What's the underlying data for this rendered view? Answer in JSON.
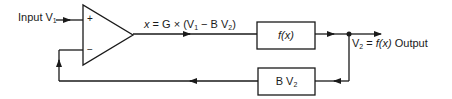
{
  "diagram": {
    "type": "feedback-amplifier-block-diagram",
    "input_label": {
      "text": "Input V",
      "sub": "1"
    },
    "amplifier": {
      "plus_sign": "+",
      "minus_sign": "−"
    },
    "equation": {
      "x": "x",
      "eq": " = G × (V",
      "sub1": "1",
      "mid": " − B V",
      "sub2": "2",
      "close": ")"
    },
    "forward_block": {
      "label": "f(x)"
    },
    "feedback_block": {
      "label": "B V",
      "sub": "2"
    },
    "output_label": {
      "pre": "V",
      "sub": "2",
      "eq": " = ",
      "fx": "f(x)",
      "post": " Output"
    }
  }
}
